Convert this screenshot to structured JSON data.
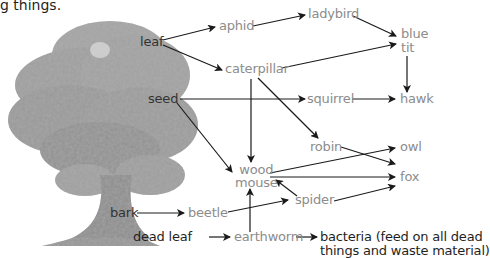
{
  "intro_text": "g things.",
  "colors": {
    "plant_label": "#333333",
    "animal_label": "#8c8c8c",
    "decomposer_label": "#1f1f1f",
    "arrow": "#1a1a1a",
    "tree_canopy": "#9a9a9a",
    "tree_shadow": "#7a7a7a"
  },
  "nodes": {
    "leaf": "leaf",
    "seed": "seed",
    "bark": "bark",
    "dead_leaf": "dead leaf",
    "aphid": "aphid",
    "ladybird": "ladybird",
    "blue_tit": "blue\ntit",
    "caterpillar": "caterpillar",
    "squirrel": "squirrel",
    "hawk": "hawk",
    "robin": "robin",
    "owl": "owl",
    "wood_mouse": "wood\nmouse",
    "fox": "fox",
    "spider": "spider",
    "beetle": "beetle",
    "earthworm": "earthworm",
    "bacteria": "bacteria (feed on all dead\nthings and waste material)"
  },
  "edges": [
    [
      "leaf",
      "aphid"
    ],
    [
      "leaf",
      "caterpillar"
    ],
    [
      "aphid",
      "ladybird"
    ],
    [
      "ladybird",
      "blue_tit"
    ],
    [
      "caterpillar",
      "blue_tit"
    ],
    [
      "blue_tit",
      "hawk"
    ],
    [
      "seed",
      "squirrel"
    ],
    [
      "squirrel",
      "hawk"
    ],
    [
      "seed",
      "wood_mouse"
    ],
    [
      "caterpillar",
      "wood_mouse"
    ],
    [
      "caterpillar",
      "robin"
    ],
    [
      "robin",
      "fox"
    ],
    [
      "wood_mouse",
      "owl"
    ],
    [
      "wood_mouse",
      "fox"
    ],
    [
      "spider",
      "wood_mouse"
    ],
    [
      "spider",
      "fox"
    ],
    [
      "bark",
      "beetle"
    ],
    [
      "beetle",
      "spider"
    ],
    [
      "dead_leaf",
      "earthworm"
    ],
    [
      "earthworm",
      "wood_mouse"
    ],
    [
      "earthworm",
      "bacteria"
    ]
  ]
}
